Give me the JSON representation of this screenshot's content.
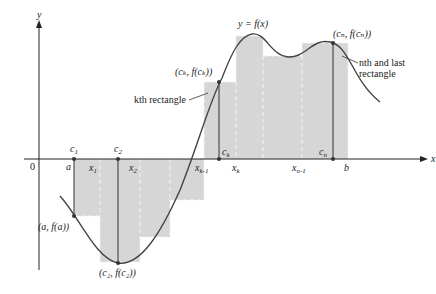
{
  "diagram": {
    "axes": {
      "x_label": "x",
      "y_label": "y",
      "origin_label": "0"
    },
    "curve_label": "y = f(x)",
    "x_labels": {
      "a": "a",
      "x1": "x",
      "x1_sub": "1",
      "x2": "x",
      "x2_sub": "2",
      "xk1": "x",
      "xk1_sub": "k-1",
      "xk": "x",
      "xk_sub": "k",
      "xn1": "x",
      "xn1_sub": "n-1",
      "b": "b"
    },
    "c_labels": {
      "c1": "c",
      "c1_sub": "1",
      "c2": "c",
      "c2_sub": "2",
      "ck": "c",
      "ck_sub": "k",
      "cn": "c",
      "cn_sub": "n"
    },
    "point_labels": {
      "a_fa": "(a, f(a))",
      "c2_fc2": "(c₂, f(c₂))",
      "ck_fck": "(cₖ, f(cₖ))",
      "cn_fcn": "(cₙ, f(cₙ))"
    },
    "annotations": {
      "kth": "kth rectangle",
      "nth_line1": "nth and last",
      "nth_line2": "rectangle"
    },
    "colors": {
      "rect_fill": "#d6d6d6",
      "curve": "#444444",
      "axis": "#222222"
    }
  }
}
